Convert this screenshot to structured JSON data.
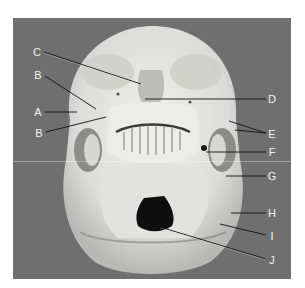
{
  "figure": {
    "background_color": "#6f6f6f",
    "bone_color": "#e6e6e2",
    "label_color": "#f2f2f2",
    "labels": [
      {
        "id": "C",
        "text": "C",
        "x": 37,
        "y": 52,
        "target": [
          133,
          83
        ]
      },
      {
        "id": "B1",
        "text": "B",
        "x": 38,
        "y": 75,
        "target": [
          96,
          109
        ]
      },
      {
        "id": "A",
        "text": "A",
        "x": 38,
        "y": 112,
        "target": [
          77,
          112
        ]
      },
      {
        "id": "B2",
        "text": "B",
        "x": 39,
        "y": 133,
        "target": [
          106,
          117
        ]
      },
      {
        "id": "D",
        "text": "D",
        "x": 272,
        "y": 99,
        "target": [
          145,
          99
        ]
      },
      {
        "id": "E",
        "text": "E",
        "x": 272,
        "y": 134,
        "targets": [
          [
            229,
            121
          ],
          [
            235,
            130
          ]
        ]
      },
      {
        "id": "F",
        "text": "F",
        "x": 272,
        "y": 152,
        "target": [
          206,
          152
        ]
      },
      {
        "id": "G",
        "text": "G",
        "x": 272,
        "y": 176,
        "target": [
          226,
          176
        ]
      },
      {
        "id": "H",
        "text": "H",
        "x": 272,
        "y": 213,
        "target": [
          231,
          213
        ]
      },
      {
        "id": "I",
        "text": "I",
        "x": 272,
        "y": 236,
        "target": [
          220,
          224
        ]
      },
      {
        "id": "J",
        "text": "J",
        "x": 272,
        "y": 260,
        "target": [
          160,
          227
        ]
      }
    ]
  }
}
